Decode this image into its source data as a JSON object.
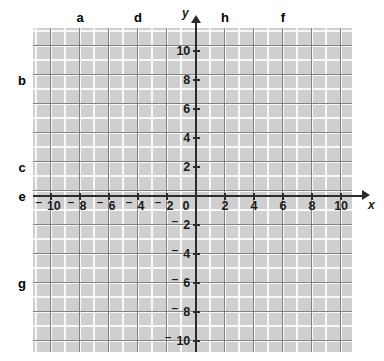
{
  "figure": {
    "kind": "cartesian-coordinate-grid",
    "background_color": "#ffffff",
    "grid_fill_color": "#cfcfcf",
    "minor_gridline_color": "#ffffff",
    "major_gridline_color": "#6e6e6e",
    "axis_color": "#2b2b2b",
    "label_color": "#000000"
  },
  "chart_data": {
    "type": "scatter",
    "title": "",
    "xlabel": "x",
    "ylabel": "y",
    "xlim": [
      -11,
      11.5
    ],
    "ylim": [
      -11.5,
      11
    ],
    "grid": true,
    "minor_grid_step": 1,
    "major_grid_step": 2,
    "legend": "none",
    "series": [],
    "x_ticks": [
      -10,
      -8,
      -6,
      -4,
      -2,
      0,
      2,
      4,
      6,
      8,
      10
    ],
    "y_ticks": [
      -10,
      -8,
      -6,
      -4,
      -2,
      2,
      4,
      6,
      8,
      10
    ],
    "x_tick_labels": [
      "–10",
      "–8",
      "–6",
      "–4",
      "–2",
      "0",
      "2",
      "4",
      "6",
      "8",
      "10"
    ],
    "y_tick_labels": [
      "–10",
      "–8",
      "–6",
      "–4",
      "–2",
      "2",
      "4",
      "6",
      "8",
      "10"
    ],
    "annotations": [
      {
        "label": "a",
        "position": "top",
        "value": -8,
        "axis": "x"
      },
      {
        "label": "d",
        "position": "top",
        "value": -4,
        "axis": "x"
      },
      {
        "label": "h",
        "position": "top",
        "value": 2,
        "axis": "x"
      },
      {
        "label": "f",
        "position": "top",
        "value": 6,
        "axis": "x"
      },
      {
        "label": "b",
        "position": "left",
        "value": 8,
        "axis": "y"
      },
      {
        "label": "c",
        "position": "left",
        "value": 2,
        "axis": "y"
      },
      {
        "label": "e",
        "position": "left",
        "value": 0,
        "axis": "y"
      },
      {
        "label": "g",
        "position": "left",
        "value": -6,
        "axis": "y"
      }
    ]
  },
  "axes": {
    "x_axis_label": "x",
    "y_axis_label": "y",
    "origin_label": "0"
  },
  "x_tick_labels": [
    {
      "text": "–10",
      "sign": "neg",
      "digits": "10"
    },
    {
      "text": "–8",
      "sign": "neg",
      "digits": "8"
    },
    {
      "text": "–6",
      "sign": "neg",
      "digits": "6"
    },
    {
      "text": "–4",
      "sign": "neg",
      "digits": "4"
    },
    {
      "text": "–2",
      "sign": "neg",
      "digits": "2"
    },
    {
      "text": "2",
      "sign": "pos",
      "digits": "2"
    },
    {
      "text": "4",
      "sign": "pos",
      "digits": "4"
    },
    {
      "text": "6",
      "sign": "pos",
      "digits": "6"
    },
    {
      "text": "8",
      "sign": "pos",
      "digits": "8"
    },
    {
      "text": "10",
      "sign": "pos",
      "digits": "10"
    }
  ],
  "y_tick_labels": [
    {
      "text": "10",
      "sign": "pos",
      "digits": "10"
    },
    {
      "text": "8",
      "sign": "pos",
      "digits": "8"
    },
    {
      "text": "6",
      "sign": "pos",
      "digits": "6"
    },
    {
      "text": "4",
      "sign": "pos",
      "digits": "4"
    },
    {
      "text": "2",
      "sign": "pos",
      "digits": "2"
    },
    {
      "text": "–2",
      "sign": "neg",
      "digits": "2"
    },
    {
      "text": "–4",
      "sign": "neg",
      "digits": "4"
    },
    {
      "text": "–6",
      "sign": "neg",
      "digits": "6"
    },
    {
      "text": "–8",
      "sign": "neg",
      "digits": "8"
    },
    {
      "text": "–10",
      "sign": "neg",
      "digits": "10"
    }
  ],
  "callouts": {
    "top": [
      {
        "id": "a",
        "label": "a"
      },
      {
        "id": "d",
        "label": "d"
      },
      {
        "id": "h",
        "label": "h"
      },
      {
        "id": "f",
        "label": "f"
      }
    ],
    "left": [
      {
        "id": "b",
        "label": "b"
      },
      {
        "id": "c",
        "label": "c"
      },
      {
        "id": "e",
        "label": "e"
      },
      {
        "id": "g",
        "label": "g"
      }
    ]
  }
}
